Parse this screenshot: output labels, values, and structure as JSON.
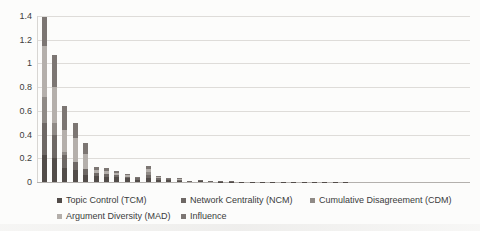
{
  "chart_data": {
    "type": "bar",
    "stacked": true,
    "title": "",
    "xlabel": "",
    "ylabel": "",
    "ylim": [
      0,
      1.4
    ],
    "ytick_step": 0.2,
    "ytick_labels": [
      "0",
      "0.2",
      "0.4",
      "0.6",
      "0.8",
      "1",
      "1.2",
      "1.4"
    ],
    "grid": true,
    "legend_position": "bottom",
    "n_bars": 30,
    "axis_color": "#b3b0ad",
    "grid_color": "#dedcd9",
    "series": [
      {
        "name": "Topic Control (TCM)",
        "color": "#524c49",
        "values": [
          0.23,
          0.2,
          0.12,
          0.1,
          0.06,
          0.05,
          0.04,
          0.04,
          0.03,
          0.02,
          0.03,
          0.02,
          0.015,
          0.012,
          0.006,
          0.008,
          0.005,
          0.004,
          0.003,
          0.004,
          0.003,
          0.003,
          0.002,
          0.002,
          0.002,
          0.001,
          0.001,
          0.001,
          0.001,
          0.001
        ]
      },
      {
        "name": "Network Centrality (NCM)",
        "color": "#6e6865",
        "values": [
          0.27,
          0.2,
          0.11,
          0.07,
          0.05,
          0.03,
          0.03,
          0.02,
          0.015,
          0.01,
          0.025,
          0.012,
          0.01,
          0.008,
          0.006,
          0.007,
          0.005,
          0.003,
          0.002,
          0,
          0,
          0,
          0,
          0,
          0,
          0,
          0,
          0,
          0,
          0
        ]
      },
      {
        "name": "Cumulative Disagreement (CDM)",
        "color": "#8f8a86",
        "values": [
          0.22,
          0.1,
          0.02,
          0,
          0,
          0,
          0,
          0,
          0,
          0,
          0.03,
          0,
          0,
          0,
          0,
          0,
          0,
          0,
          0,
          0,
          0,
          0,
          0,
          0,
          0,
          0,
          0,
          0,
          0,
          0
        ]
      },
      {
        "name": "Argument Diversity (MAD)",
        "color": "#b4afab",
        "values": [
          0.43,
          0.3,
          0.19,
          0.2,
          0.13,
          0.02,
          0.025,
          0.02,
          0.01,
          0.008,
          0.025,
          0.01,
          0.005,
          0.005,
          0,
          0,
          0,
          0,
          0,
          0,
          0,
          0,
          0,
          0,
          0,
          0,
          0,
          0,
          0,
          0
        ]
      },
      {
        "name": "Influence",
        "color": "#7c7673",
        "values": [
          0.24,
          0.27,
          0.2,
          0.13,
          0.09,
          0.025,
          0.02,
          0.015,
          0.01,
          0.007,
          0.025,
          0.008,
          0.005,
          0.005,
          0,
          0,
          0,
          0,
          0,
          0,
          0,
          0,
          0,
          0,
          0,
          0,
          0,
          0,
          0,
          0
        ]
      }
    ]
  }
}
